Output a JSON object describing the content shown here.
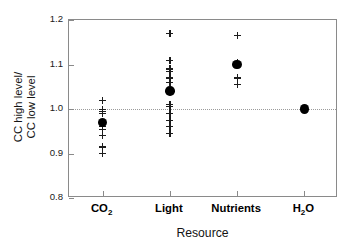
{
  "chart_data": {
    "type": "scatter",
    "title": "",
    "xlabel": "Resource",
    "ylabel_lines": [
      "CC high level/",
      "CC low level"
    ],
    "ylabel": "CC high level/ CC low level",
    "categories": [
      "CO2",
      "Light",
      "Nutrients",
      "H2O"
    ],
    "category_labels_html": [
      "CO<sub>2</sub>",
      "Light",
      "Nutrients",
      "H<sub>2</sub>O"
    ],
    "ylim": [
      0.8,
      1.2
    ],
    "yticks": [
      0.8,
      0.9,
      1.0,
      1.1,
      1.2
    ],
    "ytick_labels": [
      "0.8",
      "0.9",
      "1.0",
      "1.1",
      "1.2"
    ],
    "grid": false,
    "reference_line": {
      "value": 1.0,
      "style": "dotted",
      "color": "#9b9b9b"
    },
    "legend": null,
    "mean_marker": "filled-circle",
    "point_marker": "plus",
    "series": [
      {
        "name": "CO2",
        "mean": 0.97,
        "points": [
          1.02,
          1.0,
          0.995,
          0.99,
          0.96,
          0.955,
          0.94,
          0.915,
          0.9
        ]
      },
      {
        "name": "Light",
        "mean": 1.04,
        "points": [
          1.17,
          1.11,
          1.09,
          1.085,
          1.07,
          1.06,
          1.01,
          1.005,
          0.99,
          0.975,
          0.96,
          0.945
        ]
      },
      {
        "name": "Nutrients",
        "mean": 1.1,
        "points": [
          1.165,
          1.105,
          1.07,
          1.055
        ]
      },
      {
        "name": "H2O",
        "mean": 1.0,
        "points": []
      }
    ]
  }
}
